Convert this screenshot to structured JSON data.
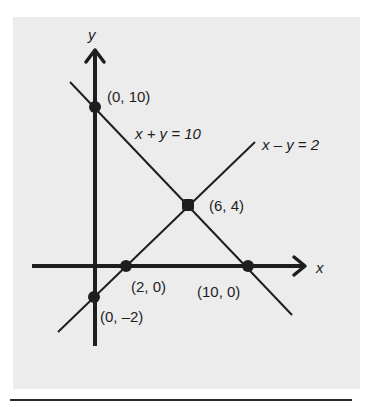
{
  "figure": {
    "axes": {
      "x_label": "x",
      "y_label": "y"
    },
    "lines": [
      {
        "name": "x + y = 10",
        "label": "x + y = 10"
      },
      {
        "name": "x - y = 2",
        "label": "x – y = 2"
      }
    ],
    "points": [
      {
        "label": "(0, 10)",
        "x": 0,
        "y": 10
      },
      {
        "label": "(6, 4)",
        "x": 6,
        "y": 4
      },
      {
        "label": "(2, 0)",
        "x": 2,
        "y": 0
      },
      {
        "label": "(10, 0)",
        "x": 10,
        "y": 0
      },
      {
        "label": "(0, –2)",
        "x": 0,
        "y": -2
      }
    ],
    "colors": {
      "panel": "#ececec",
      "ink": "#1e1e1e"
    }
  }
}
